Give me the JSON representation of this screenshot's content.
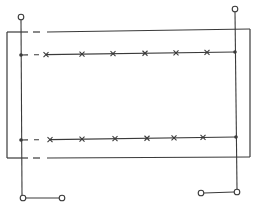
{
  "diagram": {
    "title": "",
    "colors": {
      "line": "#3a3a3a",
      "background": "#ffffff",
      "terminal_fill": "#ffffff"
    },
    "frame": {
      "x1": 7,
      "y1": 31,
      "x2": 250,
      "y2": 158,
      "gap_top": {
        "dash_start": 33,
        "dash_end": 40,
        "solid_resume": 47
      },
      "gap_bottom": {
        "dash_start": 33,
        "dash_end": 40,
        "solid_resume": 47
      }
    },
    "conductors": [
      {
        "name": "top-conductor",
        "y_left": 55,
        "y_right": 52,
        "x_left": 21,
        "x_right": 235,
        "x_marks": [
          46,
          82,
          113,
          145,
          176,
          207
        ]
      },
      {
        "name": "bottom-conductor",
        "y_left": 140,
        "y_right": 137,
        "x_left": 21,
        "x_right": 236,
        "x_marks": [
          50,
          82,
          115,
          147,
          174,
          203
        ]
      }
    ],
    "terminals": [
      {
        "name": "left-top-terminal",
        "x": 21,
        "y": 17
      },
      {
        "name": "right-top-terminal",
        "x": 235,
        "y": 9
      },
      {
        "name": "left-bottom-terminal-a",
        "x": 23,
        "y": 198
      },
      {
        "name": "left-bottom-terminal-b",
        "x": 62,
        "y": 198
      },
      {
        "name": "right-bottom-terminal-a",
        "x": 201,
        "y": 193
      },
      {
        "name": "right-bottom-terminal-b",
        "x": 237,
        "y": 192
      }
    ]
  }
}
